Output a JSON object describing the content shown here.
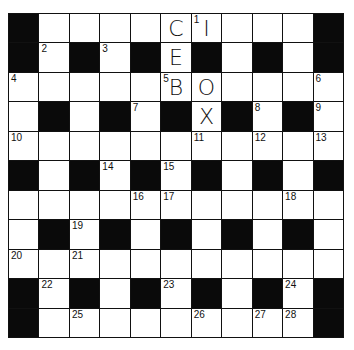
{
  "puzzle": {
    "type": "crossword",
    "rows": 11,
    "cols": 11,
    "colors": {
      "block": "#0a0a0a",
      "cell": "#ffffff",
      "border": "#111111"
    },
    "grid": [
      [
        "#",
        ".",
        ".",
        ".",
        ".",
        ".",
        ".",
        ".",
        ".",
        ".",
        "#"
      ],
      [
        "#",
        ".",
        "#",
        ".",
        "#",
        ".",
        "#",
        ".",
        "#",
        ".",
        "#"
      ],
      [
        ".",
        ".",
        ".",
        ".",
        ".",
        ".",
        ".",
        ".",
        ".",
        ".",
        "."
      ],
      [
        ".",
        "#",
        ".",
        "#",
        ".",
        "#",
        ".",
        "#",
        ".",
        "#",
        "."
      ],
      [
        ".",
        ".",
        ".",
        ".",
        ".",
        ".",
        ".",
        ".",
        ".",
        ".",
        "."
      ],
      [
        "#",
        ".",
        "#",
        ".",
        "#",
        ".",
        "#",
        ".",
        "#",
        ".",
        "#"
      ],
      [
        ".",
        ".",
        ".",
        ".",
        ".",
        ".",
        ".",
        ".",
        ".",
        ".",
        "."
      ],
      [
        ".",
        "#",
        ".",
        "#",
        ".",
        "#",
        ".",
        "#",
        ".",
        "#",
        "."
      ],
      [
        ".",
        ".",
        ".",
        ".",
        ".",
        ".",
        ".",
        ".",
        ".",
        ".",
        "."
      ],
      [
        "#",
        ".",
        "#",
        ".",
        "#",
        ".",
        "#",
        ".",
        "#",
        ".",
        "#"
      ],
      [
        "#",
        ".",
        ".",
        ".",
        ".",
        ".",
        ".",
        ".",
        ".",
        ".",
        "#"
      ]
    ],
    "numbers": [
      {
        "r": 0,
        "c": 6,
        "n": "1"
      },
      {
        "r": 1,
        "c": 1,
        "n": "2"
      },
      {
        "r": 1,
        "c": 3,
        "n": "3"
      },
      {
        "r": 2,
        "c": 0,
        "n": "4"
      },
      {
        "r": 2,
        "c": 5,
        "n": "5"
      },
      {
        "r": 2,
        "c": 10,
        "n": "6"
      },
      {
        "r": 3,
        "c": 4,
        "n": "7"
      },
      {
        "r": 3,
        "c": 8,
        "n": "8"
      },
      {
        "r": 3,
        "c": 10,
        "n": "9"
      },
      {
        "r": 4,
        "c": 0,
        "n": "10"
      },
      {
        "r": 4,
        "c": 6,
        "n": "11"
      },
      {
        "r": 4,
        "c": 8,
        "n": "12"
      },
      {
        "r": 4,
        "c": 10,
        "n": "13"
      },
      {
        "r": 5,
        "c": 3,
        "n": "14"
      },
      {
        "r": 5,
        "c": 5,
        "n": "15"
      },
      {
        "r": 6,
        "c": 4,
        "n": "16"
      },
      {
        "r": 6,
        "c": 5,
        "n": "17"
      },
      {
        "r": 6,
        "c": 9,
        "n": "18"
      },
      {
        "r": 7,
        "c": 2,
        "n": "19"
      },
      {
        "r": 8,
        "c": 0,
        "n": "20"
      },
      {
        "r": 8,
        "c": 2,
        "n": "21"
      },
      {
        "r": 9,
        "c": 1,
        "n": "22"
      },
      {
        "r": 9,
        "c": 5,
        "n": "23"
      },
      {
        "r": 9,
        "c": 9,
        "n": "24"
      },
      {
        "r": 10,
        "c": 2,
        "n": "25"
      },
      {
        "r": 10,
        "c": 6,
        "n": "26"
      },
      {
        "r": 10,
        "c": 8,
        "n": "27"
      },
      {
        "r": 10,
        "c": 9,
        "n": "28"
      }
    ],
    "letters": [
      {
        "r": 0,
        "c": 5,
        "ch": "C"
      },
      {
        "r": 0,
        "c": 6,
        "ch": "I"
      },
      {
        "r": 1,
        "c": 5,
        "ch": "E"
      },
      {
        "r": 2,
        "c": 5,
        "ch": "B"
      },
      {
        "r": 2,
        "c": 6,
        "ch": "O"
      },
      {
        "r": 3,
        "c": 6,
        "ch": "X"
      }
    ]
  }
}
